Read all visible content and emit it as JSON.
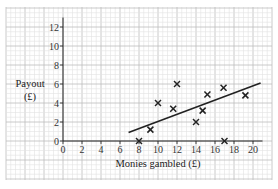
{
  "chart_data": {
    "type": "scatter",
    "title": "",
    "xlabel": "Monies gambled (£)",
    "ylabel": "Payout (£)",
    "ylabel_lines": [
      "Payout",
      "(£)"
    ],
    "xlim": [
      0,
      21
    ],
    "ylim": [
      0,
      13
    ],
    "x_ticks": [
      0,
      2,
      4,
      6,
      8,
      10,
      12,
      14,
      16,
      18,
      20
    ],
    "y_ticks": [
      0,
      2,
      4,
      6,
      8,
      10,
      12
    ],
    "grid": true,
    "marker": "x",
    "points": [
      {
        "x": 8,
        "y": 0
      },
      {
        "x": 9.2,
        "y": 1.2
      },
      {
        "x": 10,
        "y": 4
      },
      {
        "x": 11.6,
        "y": 3.4
      },
      {
        "x": 12,
        "y": 6
      },
      {
        "x": 14,
        "y": 2
      },
      {
        "x": 14.7,
        "y": 3.2
      },
      {
        "x": 15.2,
        "y": 4.9
      },
      {
        "x": 16.9,
        "y": 5.6
      },
      {
        "x": 17,
        "y": 0
      },
      {
        "x": 19.2,
        "y": 4.8
      }
    ],
    "line_of_best_fit": {
      "x1": 6.9,
      "y1": 0.9,
      "x2": 20.8,
      "y2": 6.1
    }
  },
  "colors": {
    "grid_minor": "#e2e2e2",
    "grid_major": "#bdbdbd",
    "axis": "#222222",
    "marker": "#222222"
  }
}
